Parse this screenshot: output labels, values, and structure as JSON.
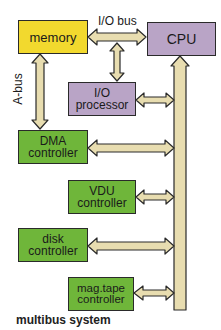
{
  "diagram": {
    "title": "multibus system",
    "colors": {
      "memory": "#f2d92e",
      "processor": "#b9a4c6",
      "controller": "#6fb63a",
      "bus": "#e8ddb0",
      "outline": "#2a2a2a"
    },
    "buses": {
      "io_bus_label": "I/O bus",
      "a_bus_label": "A-bus"
    },
    "nodes": {
      "memory": {
        "line1": "memory"
      },
      "cpu": {
        "line1": "CPU"
      },
      "io_processor": {
        "line1": "I/O",
        "line2": "processor"
      },
      "dma": {
        "line1": "DMA",
        "line2": "controller"
      },
      "vdu": {
        "line1": "VDU",
        "line2": "controller"
      },
      "disk": {
        "line1": "disk",
        "line2": "controller"
      },
      "magtape": {
        "line1": "mag.tape",
        "line2": "controller"
      }
    },
    "edges": [
      {
        "from": "memory",
        "to": "cpu",
        "label": "I/O bus",
        "type": "bidirectional"
      },
      {
        "from": "io-bus",
        "to": "io_processor",
        "type": "bidirectional"
      },
      {
        "from": "memory",
        "to": "dma",
        "label": "A-bus",
        "type": "bidirectional"
      },
      {
        "from": "io_processor",
        "to": "multibus",
        "type": "bidirectional"
      },
      {
        "from": "dma",
        "to": "multibus",
        "type": "bidirectional"
      },
      {
        "from": "vdu",
        "to": "multibus",
        "type": "bidirectional"
      },
      {
        "from": "disk",
        "to": "multibus",
        "type": "bidirectional"
      },
      {
        "from": "magtape",
        "to": "multibus",
        "type": "bidirectional"
      },
      {
        "from": "multibus",
        "to": "cpu",
        "type": "unidirectional"
      }
    ]
  }
}
